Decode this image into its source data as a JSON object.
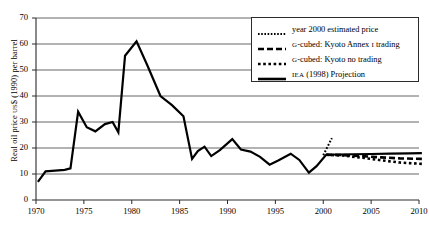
{
  "chart_data": {
    "type": "line",
    "title": "",
    "xlabel": "",
    "ylabel": "Real oil price US$ (1990) per barrel",
    "ylabel_parts": {
      "pre": "Real oil price ",
      "sc": "US",
      "post": "$ (1990) per barrel"
    },
    "xlim": [
      1970,
      2010
    ],
    "ylim": [
      0,
      70
    ],
    "ytick_values": [
      0,
      10,
      20,
      30,
      40,
      50,
      60,
      70
    ],
    "ytick_labels": [
      "0",
      "10",
      "20",
      "30",
      "40",
      "50",
      "60",
      "70"
    ],
    "xtick_values": [
      1970,
      1975,
      1980,
      1985,
      1990,
      1995,
      2000,
      2005,
      2010
    ],
    "xtick_labels": [
      "1970",
      "1975",
      "1980",
      "1985",
      "1990",
      "1995",
      "2000",
      "2005",
      "2010"
    ],
    "grid": "horizontal",
    "legend_position": "top-right",
    "series": [
      {
        "name": "IEA (1998) Projection",
        "key": "iea",
        "style": "solid",
        "points": [
          [
            1970.2,
            7.0
          ],
          [
            1971.0,
            11.0
          ],
          [
            1972.0,
            11.3
          ],
          [
            1973.0,
            11.6
          ],
          [
            1973.6,
            12.2
          ],
          [
            1974.4,
            34.0
          ],
          [
            1975.3,
            28.0
          ],
          [
            1976.2,
            26.4
          ],
          [
            1977.2,
            29.2
          ],
          [
            1978.0,
            30.0
          ],
          [
            1978.6,
            26.0
          ],
          [
            1979.3,
            55.5
          ],
          [
            1980.5,
            61.0
          ],
          [
            1981.6,
            52.0
          ],
          [
            1983.0,
            40.0
          ],
          [
            1984.2,
            36.5
          ],
          [
            1985.4,
            32.2
          ],
          [
            1986.3,
            15.8
          ],
          [
            1986.9,
            18.8
          ],
          [
            1987.6,
            20.5
          ],
          [
            1988.3,
            16.9
          ],
          [
            1989.2,
            19.2
          ],
          [
            1990.5,
            23.4
          ],
          [
            1991.4,
            19.4
          ],
          [
            1992.4,
            18.6
          ],
          [
            1993.4,
            16.6
          ],
          [
            1994.4,
            13.6
          ],
          [
            1995.3,
            15.2
          ],
          [
            1996.6,
            17.8
          ],
          [
            1997.5,
            15.4
          ],
          [
            1998.5,
            10.5
          ],
          [
            1999.3,
            13.0
          ],
          [
            2000.3,
            17.4
          ],
          [
            2001.5,
            17.5
          ],
          [
            2003.0,
            17.6
          ],
          [
            2005.0,
            17.7
          ],
          [
            2007.0,
            17.8
          ],
          [
            2009.0,
            17.9
          ],
          [
            2010.3,
            18.0
          ]
        ]
      },
      {
        "name": "G-cubed: Kyoto Annex I trading",
        "key": "annex_trading",
        "style": "dashed",
        "points": [
          [
            2000.3,
            17.4
          ],
          [
            2002.0,
            17.3
          ],
          [
            2004.0,
            16.9
          ],
          [
            2006.0,
            16.4
          ],
          [
            2008.0,
            16.0
          ],
          [
            2010.3,
            15.8
          ]
        ]
      },
      {
        "name": "G-cubed: Kyoto no trading",
        "key": "no_trading",
        "style": "dotted",
        "points": [
          [
            2000.3,
            17.4
          ],
          [
            2002.0,
            17.1
          ],
          [
            2004.0,
            16.3
          ],
          [
            2006.0,
            15.3
          ],
          [
            2008.0,
            14.4
          ],
          [
            2010.3,
            13.9
          ]
        ]
      },
      {
        "name": "year 2000 estimated price",
        "key": "est2000",
        "style": "dotted-steep",
        "points": [
          [
            2000.0,
            17.2
          ],
          [
            2000.9,
            23.8
          ]
        ]
      }
    ],
    "legend_entries": [
      {
        "label": "year 2000 estimated price",
        "style": "dotted",
        "prefix": ""
      },
      {
        "label": "-cubed: Kyoto Annex ",
        "style": "dashed",
        "prefix": "G",
        "suffix_sc": "I",
        "tail": " trading"
      },
      {
        "label": "-cubed: Kyoto no trading",
        "style": "dotted",
        "prefix": "G"
      },
      {
        "label": " (1998) Projection",
        "style": "solid",
        "prefix_sc": "IEA"
      }
    ]
  }
}
